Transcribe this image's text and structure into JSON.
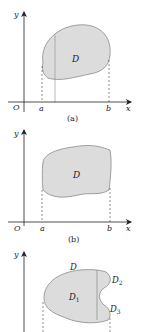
{
  "panels": [
    {
      "id": "a",
      "caption": "(a)",
      "labels": {
        "y_axis": "y",
        "x_axis": "x",
        "origin": "O",
        "a": "a",
        "b": "b",
        "region": "D"
      }
    },
    {
      "id": "b",
      "caption": "(b)",
      "labels": {
        "y_axis": "y",
        "x_axis": "x",
        "origin": "O",
        "a": "a",
        "b": "b",
        "region": "D"
      }
    },
    {
      "id": "c",
      "caption": "",
      "labels": {
        "y_axis": "y",
        "region": "D",
        "sub1": "D",
        "sub1_idx": "1",
        "sub2": "D",
        "sub2_idx": "2",
        "sub3": "D",
        "sub3_idx": "3"
      }
    }
  ],
  "colors": {
    "fill": "#dcdcdc",
    "stroke": "#8a8a8a",
    "axis": "#222222"
  }
}
